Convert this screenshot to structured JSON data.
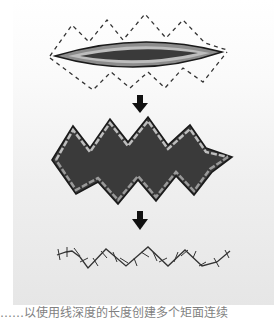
{
  "figure": {
    "steps": [
      {
        "name": "elliptical-wound-with-zigzag-incision-outline"
      },
      {
        "name": "excised-zigzag-wound"
      },
      {
        "name": "sutured-zigzag-line"
      }
    ],
    "arrows": 2,
    "colors": {
      "outline": "#1a1a1a",
      "wound_outer": "#8c8c8c",
      "wound_mid": "#bdbdbd",
      "wound_inner": "#3a3a3a",
      "dash": "#333333"
    }
  },
  "caption": {
    "text": "……以使用线深度的长度创建多个矩面连续"
  }
}
